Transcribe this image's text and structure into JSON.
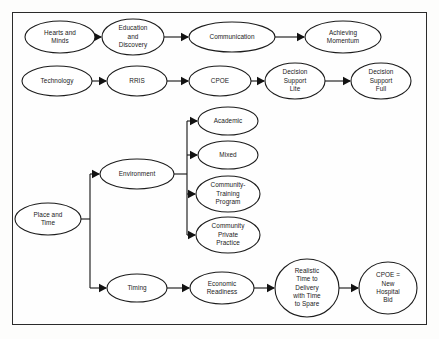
{
  "diagram": {
    "title": "",
    "colors": {
      "stroke": "#1c1c1c",
      "node_fill": "#ffffff",
      "frame": "#2b2b2b",
      "background": "#fdfdfc",
      "text": "#1a1a1a"
    },
    "nodes": [
      {
        "id": "hearts-and-minds",
        "lines": [
          "Hearts and",
          "Minds"
        ],
        "cx": 60,
        "cy": 37,
        "rx": 35,
        "ry": 16
      },
      {
        "id": "education-and-discovery",
        "lines": [
          "Education",
          "and",
          "Discovery"
        ],
        "cx": 133,
        "cy": 37,
        "rx": 31,
        "ry": 18
      },
      {
        "id": "communication",
        "lines": [
          "Communication"
        ],
        "cx": 232,
        "cy": 37,
        "rx": 43,
        "ry": 15
      },
      {
        "id": "achieving-momentum",
        "lines": [
          "Achieving",
          "Momentum"
        ],
        "cx": 343,
        "cy": 37,
        "rx": 38,
        "ry": 16
      },
      {
        "id": "technology",
        "lines": [
          "Technology"
        ],
        "cx": 57,
        "cy": 81,
        "rx": 35,
        "ry": 15
      },
      {
        "id": "rris",
        "lines": [
          "RRIS"
        ],
        "cx": 137,
        "cy": 81,
        "rx": 30,
        "ry": 15
      },
      {
        "id": "cpoe",
        "lines": [
          "CPOE"
        ],
        "cx": 220,
        "cy": 81,
        "rx": 31,
        "ry": 15
      },
      {
        "id": "decision-support-lite",
        "lines": [
          "Decision",
          "Support",
          "Lite"
        ],
        "cx": 295,
        "cy": 81,
        "rx": 30,
        "ry": 18
      },
      {
        "id": "decision-support-full",
        "lines": [
          "Decision",
          "Support",
          "Full"
        ],
        "cx": 381,
        "cy": 81,
        "rx": 30,
        "ry": 18
      },
      {
        "id": "place-and-time",
        "lines": [
          "Place and",
          "Time"
        ],
        "cx": 48,
        "cy": 219,
        "rx": 33,
        "ry": 16
      },
      {
        "id": "environment",
        "lines": [
          "Environment"
        ],
        "cx": 137,
        "cy": 174,
        "rx": 37,
        "ry": 15
      },
      {
        "id": "academic",
        "lines": [
          "Academic"
        ],
        "cx": 228,
        "cy": 121,
        "rx": 30,
        "ry": 14
      },
      {
        "id": "mixed",
        "lines": [
          "Mixed"
        ],
        "cx": 228,
        "cy": 155,
        "rx": 30,
        "ry": 14
      },
      {
        "id": "community-training-program",
        "lines": [
          "Community-",
          "Training",
          "Program"
        ],
        "cx": 228,
        "cy": 194,
        "rx": 32,
        "ry": 18
      },
      {
        "id": "community-private-practice",
        "lines": [
          "Community",
          "Private",
          "Practice"
        ],
        "cx": 228,
        "cy": 235,
        "rx": 32,
        "ry": 18
      },
      {
        "id": "timing",
        "lines": [
          "Timing"
        ],
        "cx": 137,
        "cy": 288,
        "rx": 30,
        "ry": 14
      },
      {
        "id": "economic-readiness",
        "lines": [
          "Economic",
          "Readiness"
        ],
        "cx": 222,
        "cy": 288,
        "rx": 32,
        "ry": 16
      },
      {
        "id": "realistic-time-to-delivery",
        "lines": [
          "Realistic",
          "Time to",
          "Delivery",
          "with Time",
          "to Spare"
        ],
        "cx": 307,
        "cy": 288,
        "rx": 32,
        "ry": 29
      },
      {
        "id": "cpoe-new-hospital-bid",
        "lines": [
          "CPOE =",
          "New",
          "Hospital",
          "Bid"
        ],
        "cx": 388,
        "cy": 288,
        "rx": 29,
        "ry": 26
      }
    ],
    "edges": [
      {
        "from": "hearts-and-minds",
        "to": "education-and-discovery",
        "kind": "straight"
      },
      {
        "from": "education-and-discovery",
        "to": "communication",
        "kind": "straight"
      },
      {
        "from": "communication",
        "to": "achieving-momentum",
        "kind": "straight"
      },
      {
        "from": "technology",
        "to": "rris",
        "kind": "straight"
      },
      {
        "from": "rris",
        "to": "cpoe",
        "kind": "straight"
      },
      {
        "from": "cpoe",
        "to": "decision-support-lite",
        "kind": "straight"
      },
      {
        "from": "decision-support-lite",
        "to": "decision-support-full",
        "kind": "straight"
      },
      {
        "from": "place-and-time",
        "to": "environment",
        "kind": "bus"
      },
      {
        "from": "place-and-time",
        "to": "timing",
        "kind": "bus"
      },
      {
        "from": "environment",
        "to": "academic",
        "kind": "bus"
      },
      {
        "from": "environment",
        "to": "mixed",
        "kind": "bus"
      },
      {
        "from": "environment",
        "to": "community-training-program",
        "kind": "bus"
      },
      {
        "from": "environment",
        "to": "community-private-practice",
        "kind": "bus"
      },
      {
        "from": "timing",
        "to": "economic-readiness",
        "kind": "straight"
      },
      {
        "from": "economic-readiness",
        "to": "realistic-time-to-delivery",
        "kind": "straight"
      },
      {
        "from": "realistic-time-to-delivery",
        "to": "cpoe-new-hospital-bid",
        "kind": "straight"
      }
    ],
    "buses": [
      {
        "id": "place-and-time-bus",
        "stub_x": 90,
        "spine_x": 90,
        "y_top": 174,
        "y_bottom": 288,
        "source_y": 219
      },
      {
        "id": "environment-bus",
        "stub_x": 187,
        "spine_x": 187,
        "y_top": 121,
        "y_bottom": 235,
        "source_y": 174
      }
    ]
  }
}
